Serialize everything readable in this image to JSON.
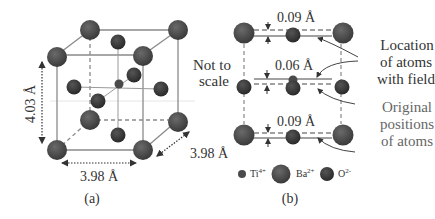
{
  "colors": {
    "atom_dark": "#3a3a3a",
    "atom_mid": "#4a4a4a",
    "edge": "#888888",
    "text": "#333333",
    "text_soft": "#666666",
    "background": "#ffffff"
  },
  "panel_a": {
    "caption": "(a)",
    "note_line1": "Not to",
    "note_line2": "scale",
    "height_label": "4.03 Å",
    "width_label": "3.98 Å",
    "depth_label": "3.98 Å"
  },
  "panel_b": {
    "caption": "(b)",
    "displacements": [
      "0.09 Å",
      "0.06 Å",
      "0.09 Å"
    ],
    "annotation_with_field": [
      "Location",
      "of atoms",
      "with field"
    ],
    "annotation_original": [
      "Original",
      "positions",
      "of atoms"
    ]
  },
  "legend": {
    "items": [
      {
        "ion": "Ti",
        "charge": "4+",
        "size": "small"
      },
      {
        "ion": "Ba",
        "charge": "2+",
        "size": "large"
      },
      {
        "ion": "O",
        "charge": "2-",
        "size": "medium"
      }
    ]
  }
}
